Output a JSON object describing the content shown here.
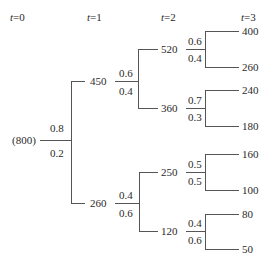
{
  "headers": [
    {
      "var": "t",
      "eq": "=0"
    },
    {
      "var": "t",
      "eq": "=1"
    },
    {
      "var": "t",
      "eq": "=2"
    },
    {
      "var": "t",
      "eq": "=3"
    }
  ],
  "tree": {
    "root": "(800)",
    "t1": {
      "up": "450",
      "down": "260",
      "p_up": "0.8",
      "p_down": "0.2"
    },
    "t2": {
      "from450": {
        "up": "520",
        "down": "360",
        "p_up": "0.6",
        "p_down": "0.4"
      },
      "from260": {
        "up": "250",
        "down": "120",
        "p_up": "0.4",
        "p_down": "0.6"
      }
    },
    "t3": {
      "from520": {
        "up": "400",
        "down": "260",
        "p_up": "0.6",
        "p_down": "0.4"
      },
      "from360": {
        "up": "240",
        "down": "180",
        "p_up": "0.7",
        "p_down": "0.3"
      },
      "from250": {
        "up": "160",
        "down": "100",
        "p_up": "0.5",
        "p_down": "0.5"
      },
      "from120": {
        "up": "80",
        "down": "50",
        "p_up": "0.4",
        "p_down": "0.6"
      }
    }
  },
  "colors": {
    "line": "#555555",
    "text": "#2a2a2a"
  }
}
